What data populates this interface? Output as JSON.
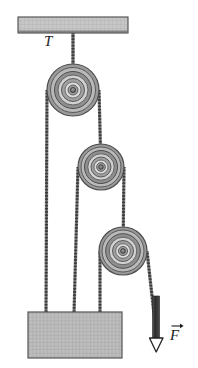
{
  "figure": {
    "kind": "physics-pulley-diagram",
    "background_color": "#ffffff"
  },
  "labels": {
    "tension": "T",
    "force": "F",
    "force_is_vector": true,
    "tension_is_vector": false
  },
  "palette": {
    "ceiling_fill": "#bfbfbf",
    "ceiling_stroke": "#4a4a4a",
    "block_fill": "#c4c4c4",
    "block_stroke": "#555555",
    "pulley_rim_outer": "#8f8f8f",
    "pulley_rim_mid": "#b2b2b2",
    "pulley_groove": "#6e6e6e",
    "pulley_inner": "#d8d8d8",
    "pulley_hub": "#7a7a7a",
    "rope": "#5a5a5a",
    "rope_dark": "#2e2e2e",
    "weight_bar": "#3a3a3a",
    "ink": "#1c1c1c"
  },
  "ceiling": {
    "name": "ceiling-support",
    "x": 18,
    "y": 17,
    "width": 110,
    "height": 16,
    "hatch": "fine-grid"
  },
  "block": {
    "name": "load-block",
    "x": 28,
    "y": 312,
    "width": 94,
    "height": 46,
    "hatch": "fine-grid",
    "rope_attachments": [
      46,
      74,
      100
    ]
  },
  "pulleys": [
    {
      "id": 1,
      "name": "pulley-top",
      "cx": 73,
      "cy": 90,
      "r": 26,
      "rings": [
        26,
        22.5,
        18.5,
        15,
        11.5,
        8,
        5,
        2.6
      ]
    },
    {
      "id": 2,
      "name": "pulley-middle",
      "cx": 101,
      "cy": 167,
      "r": 23,
      "rings": [
        23,
        20,
        16.5,
        13.2,
        10,
        7,
        4.4,
        2.3
      ]
    },
    {
      "id": 3,
      "name": "pulley-bottom",
      "cx": 123,
      "cy": 251,
      "r": 24,
      "rings": [
        24,
        21,
        17.3,
        13.8,
        10.5,
        7.3,
        4.6,
        2.4
      ]
    }
  ],
  "ropes": [
    {
      "name": "rope-ceiling-to-pulley1",
      "label": "T",
      "from": [
        73,
        33
      ],
      "to": [
        73,
        90
      ]
    },
    {
      "name": "rope-pulley1-left-to-block",
      "from": [
        47,
        90
      ],
      "to": [
        46,
        312
      ]
    },
    {
      "name": "rope-pulley1-right-to-pulley2",
      "from": [
        99,
        90
      ],
      "to": [
        101,
        167
      ]
    },
    {
      "name": "rope-pulley2-left-to-block",
      "from": [
        78,
        167
      ],
      "to": [
        74,
        312
      ]
    },
    {
      "name": "rope-pulley2-right-to-pulley3",
      "from": [
        124,
        167
      ],
      "to": [
        123,
        251
      ]
    },
    {
      "name": "rope-pulley3-left-to-block",
      "from": [
        99,
        251
      ],
      "to": [
        100,
        312
      ]
    },
    {
      "name": "rope-pulley3-right-to-force",
      "from": [
        147,
        251
      ],
      "to": [
        156,
        330
      ]
    }
  ],
  "force_indicator": {
    "name": "applied-force-arrow",
    "bar_x": 156,
    "bar_top": 295,
    "bar_bottom": 338,
    "arrow_tip_y": 352,
    "direction": "down",
    "arrowhead_style": "open-triangle"
  }
}
